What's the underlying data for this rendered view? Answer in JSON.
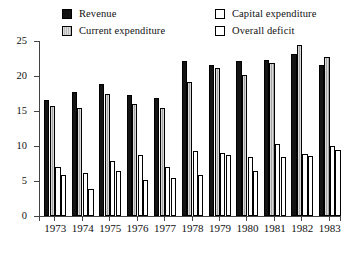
{
  "chart_data": {
    "type": "bar",
    "title": "",
    "xlabel": "",
    "ylabel": "",
    "ylim": [
      0,
      25
    ],
    "yticks": [
      0,
      5,
      10,
      15,
      20,
      25
    ],
    "grid": false,
    "legend_position": "top",
    "categories": [
      "1973",
      "1974",
      "1975",
      "1976",
      "1977",
      "1978",
      "1979",
      "1980",
      "1981",
      "1982",
      "1983"
    ],
    "series": [
      {
        "name": "Revenue",
        "color": "#141414",
        "pattern": "solid-black",
        "values": [
          16.6,
          17.7,
          18.9,
          17.3,
          16.8,
          22.2,
          21.6,
          22.2,
          22.3,
          23.2,
          21.6
        ]
      },
      {
        "name": "Current expenditure",
        "color": "#b0b0b0",
        "pattern": "light-gray-vertical-lines",
        "values": [
          15.7,
          15.4,
          17.5,
          16.0,
          15.4,
          19.1,
          21.1,
          20.1,
          21.9,
          24.5,
          22.7
        ]
      },
      {
        "name": "Capital expenditure",
        "color": "#ffffff",
        "pattern": "white-stippled",
        "values": [
          7.0,
          6.2,
          7.9,
          8.7,
          7.0,
          9.3,
          9.0,
          8.4,
          10.3,
          8.9,
          10.0
        ]
      },
      {
        "name": "Overall deficit",
        "color": "#ffffff",
        "pattern": "white-stippled",
        "values": [
          5.8,
          3.8,
          6.4,
          5.2,
          5.5,
          5.8,
          8.7,
          6.4,
          8.5,
          8.6,
          9.5
        ]
      }
    ]
  },
  "legend": {
    "items": [
      {
        "label": "Revenue",
        "swatch": "solid-black-swatch"
      },
      {
        "label": "Current expenditure",
        "swatch": "gray-hatched-swatch"
      },
      {
        "label": "Capital expenditure",
        "swatch": "white-swatch"
      },
      {
        "label": "Overall deficit",
        "swatch": "white-swatch"
      }
    ]
  },
  "axis": {
    "y_tick_labels": [
      "0",
      "5",
      "10",
      "15",
      "20",
      "25"
    ],
    "x_tick_labels": [
      "1973",
      "1974",
      "1975",
      "1976",
      "1977",
      "1978",
      "1979",
      "1980",
      "1981",
      "1982",
      "1983"
    ]
  }
}
